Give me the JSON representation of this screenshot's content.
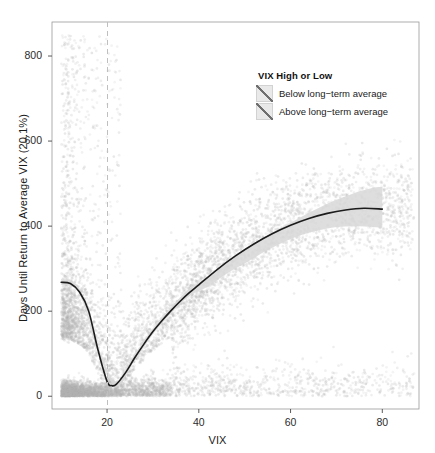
{
  "chart_data": {
    "type": "scatter",
    "title": "",
    "xlabel": "VIX",
    "ylabel": "Days Until Return to Average VIX (20.1%)",
    "xlim": [
      8,
      88
    ],
    "ylim": [
      -30,
      880
    ],
    "xticks": [
      20,
      40,
      60,
      80
    ],
    "yticks": [
      0,
      200,
      400,
      600,
      800
    ],
    "grid": false,
    "panel_border": true,
    "annotations": [
      {
        "name": "average-vix-reference-line",
        "type": "vline",
        "x": 20.1,
        "label": "Average VIX 20.1%",
        "style": "dashed",
        "color": "#bfbfbf"
      }
    ],
    "legend": {
      "position": "top-right-inside",
      "title": "VIX High or Low",
      "entries": [
        {
          "label": "Below long−term average",
          "fill": "#e9e9e9"
        },
        {
          "label": "Above long−term average",
          "fill": "#e9e9e9"
        }
      ]
    },
    "series": [
      {
        "name": "observations",
        "type": "scatter",
        "color": "#c9c9c9",
        "point_alpha": 0.25,
        "point_size": 1.4,
        "description": "Dense cloud of daily observations; heavy mass below 20 days near VIX 18-26, long upper tail to 850 days for VIX 10-22, thinning tail out to VIX 85."
      },
      {
        "name": "loess-fit",
        "type": "line",
        "color": "#1c1c1c",
        "x": [
          10,
          12,
          14,
          16,
          18,
          20,
          21,
          22,
          24,
          26,
          28,
          30,
          32,
          34,
          36,
          38,
          40,
          44,
          48,
          52,
          56,
          60,
          64,
          68,
          72,
          76,
          80
        ],
        "y": [
          268,
          265,
          245,
          200,
          110,
          35,
          25,
          28,
          55,
          90,
          122,
          152,
          178,
          202,
          224,
          244,
          262,
          298,
          330,
          358,
          382,
          402,
          418,
          430,
          438,
          442,
          440
        ]
      },
      {
        "name": "confidence-ribbon",
        "type": "band",
        "color": "#d8d8d8",
        "x": [
          10,
          14,
          18,
          22,
          26,
          30,
          34,
          38,
          42,
          46,
          50,
          54,
          58,
          62,
          66,
          70,
          74,
          78,
          80
        ],
        "ylow": [
          262,
          240,
          105,
          23,
          84,
          146,
          196,
          236,
          258,
          288,
          312,
          338,
          360,
          378,
          390,
          398,
          400,
          398,
          396
        ],
        "yhigh": [
          276,
          252,
          118,
          34,
          98,
          160,
          210,
          254,
          278,
          312,
          342,
          372,
          396,
          420,
          442,
          462,
          478,
          490,
          492
        ]
      }
    ]
  }
}
